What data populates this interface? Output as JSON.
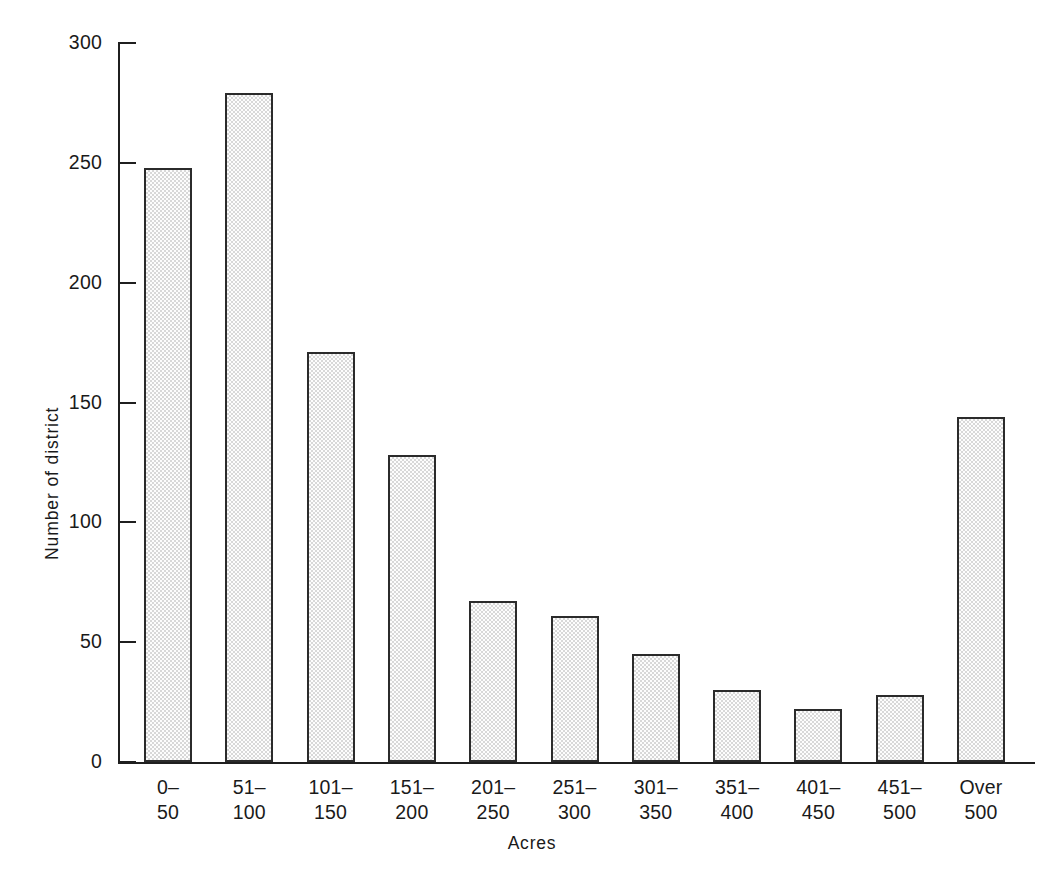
{
  "chart_data": {
    "type": "bar",
    "title": "",
    "xlabel": "Acres",
    "ylabel": "Number of district",
    "categories": [
      "0–50",
      "51–100",
      "101–150",
      "151–200",
      "201–250",
      "251–300",
      "301–350",
      "351–400",
      "401–450",
      "451–500",
      "Over 500"
    ],
    "category_lines": [
      [
        "0–",
        "50"
      ],
      [
        "51–",
        "100"
      ],
      [
        "101–",
        "150"
      ],
      [
        "151–",
        "200"
      ],
      [
        "201–",
        "250"
      ],
      [
        "251–",
        "300"
      ],
      [
        "301–",
        "350"
      ],
      [
        "351–",
        "400"
      ],
      [
        "401–",
        "450"
      ],
      [
        "451–",
        "500"
      ],
      [
        "Over",
        "500"
      ]
    ],
    "values": [
      248,
      279,
      171,
      128,
      67,
      61,
      45,
      30,
      22,
      28,
      144
    ],
    "ylim": [
      0,
      300
    ],
    "yticks": [
      0,
      50,
      100,
      150,
      200,
      250,
      300
    ],
    "ytick_labels": [
      "0",
      "50",
      "100",
      "150",
      "200",
      "250",
      "300"
    ],
    "grid": false,
    "legend": "none",
    "bar_fill": "#d8d8d8",
    "bar_fill_style": "checkerboard-stipple",
    "bar_edge_color": "#2b2b2b",
    "axis_color": "#1f1f1f"
  },
  "page": {
    "bottom_artifact": " "
  }
}
